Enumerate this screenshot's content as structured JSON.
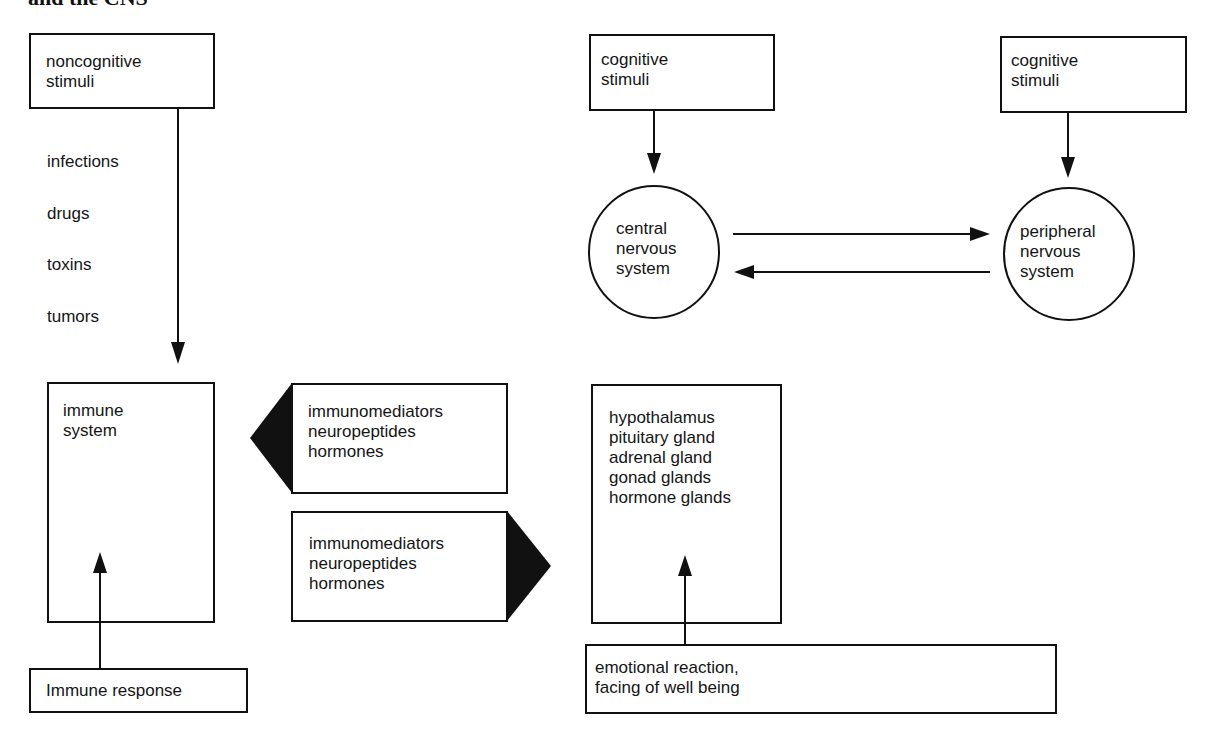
{
  "title": "and the CNS",
  "nodes": {
    "noncognitive": {
      "label": "noncognitive\nstimuli"
    },
    "noncognitive_examples": [
      "infections",
      "drugs",
      "toxins",
      "tumors"
    ],
    "immune_system": {
      "label": "immune\nsystem"
    },
    "immune_response": {
      "label": "Immune response"
    },
    "mediators_to_immune": {
      "label": "immunomediators\nneuropeptides\nhormones",
      "direction": "left"
    },
    "mediators_to_endocrine": {
      "label": "immunomediators\nneuropeptides\nhormones",
      "direction": "right"
    },
    "cognitive_1": {
      "label": "cognitive\nstimuli"
    },
    "cognitive_2": {
      "label": "cognitive\nstimuli"
    },
    "cns": {
      "label": "central\nnervous\nsystem"
    },
    "pns": {
      "label": "peripheral\nnervous\nsystem"
    },
    "endocrine": {
      "label": "hypothalamus\npituitary gland\nadrenal gland\ngonad glands\nhormone glands"
    },
    "emotional": {
      "label": "emotional reaction,\nfacing of well being"
    }
  },
  "edges": [
    {
      "from": "noncognitive",
      "to": "immune_system"
    },
    {
      "from": "immune_response",
      "to": "immune_system"
    },
    {
      "from": "cognitive_1",
      "to": "cns"
    },
    {
      "from": "cognitive_2",
      "to": "pns"
    },
    {
      "from": "cns",
      "to": "pns"
    },
    {
      "from": "pns",
      "to": "cns"
    },
    {
      "from": "emotional",
      "to": "endocrine"
    },
    {
      "from": "mediators_to_immune",
      "to": "immune_system"
    },
    {
      "from": "mediators_to_endocrine",
      "to": "endocrine"
    }
  ],
  "colors": {
    "stroke": "#111111",
    "background": "#ffffff"
  }
}
